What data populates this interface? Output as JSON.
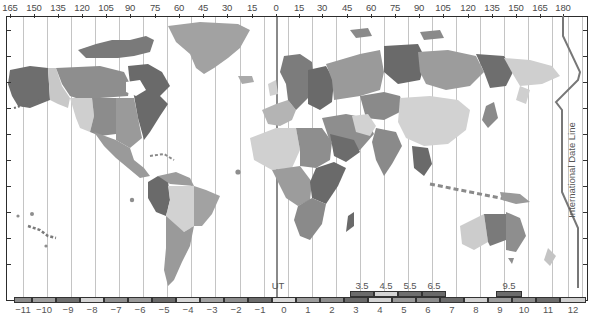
{
  "map": {
    "title": "World Time Zones",
    "longitude_labels": [
      {
        "label": "165",
        "x": 10
      },
      {
        "label": "150",
        "x": 34
      },
      {
        "label": "135",
        "x": 58
      },
      {
        "label": "120",
        "x": 82
      },
      {
        "label": "105",
        "x": 106
      },
      {
        "label": "90",
        "x": 130
      },
      {
        "label": "75",
        "x": 155
      },
      {
        "label": "60",
        "x": 179
      },
      {
        "label": "45",
        "x": 203
      },
      {
        "label": "30",
        "x": 227
      },
      {
        "label": "15",
        "x": 252
      },
      {
        "label": "0",
        "x": 276
      },
      {
        "label": "15",
        "x": 299
      },
      {
        "label": "30",
        "x": 322
      },
      {
        "label": "45",
        "x": 347
      },
      {
        "label": "60",
        "x": 371
      },
      {
        "label": "75",
        "x": 395
      },
      {
        "label": "90",
        "x": 419
      },
      {
        "label": "105",
        "x": 443
      },
      {
        "label": "120",
        "x": 468
      },
      {
        "label": "135",
        "x": 492
      },
      {
        "label": "150",
        "x": 516
      },
      {
        "label": "165",
        "x": 540
      },
      {
        "label": "180",
        "x": 563
      }
    ],
    "meridian_x": [
      23,
      47,
      71,
      95,
      119,
      143,
      167,
      191,
      215,
      240,
      264,
      276,
      288,
      312,
      336,
      360,
      384,
      408,
      432,
      456,
      480,
      504,
      528,
      552,
      568,
      582
    ],
    "ut_meridian_x": 276,
    "ut_label": "UT",
    "date_line_label": "International Date Line",
    "zone_strip": [
      {
        "label": "−11",
        "x": 14,
        "w": 18,
        "color": "#8c8c8c"
      },
      {
        "label": "−10",
        "x": 32,
        "w": 24,
        "color": "#9e9e9e"
      },
      {
        "label": "−9",
        "x": 56,
        "w": 24,
        "color": "#6e6e6e"
      },
      {
        "label": "−8",
        "x": 80,
        "w": 24,
        "color": "#d4d4d4"
      },
      {
        "label": "−7",
        "x": 104,
        "w": 24,
        "color": "#8e8e8e"
      },
      {
        "label": "−6",
        "x": 128,
        "w": 24,
        "color": "#9a9a9a"
      },
      {
        "label": "−5",
        "x": 152,
        "w": 24,
        "color": "#6a6a6a"
      },
      {
        "label": "−4",
        "x": 176,
        "w": 24,
        "color": "#d6d6d6"
      },
      {
        "label": "−3",
        "x": 200,
        "w": 24,
        "color": "#a2a2a2"
      },
      {
        "label": "−2",
        "x": 224,
        "w": 24,
        "color": "#8e8e8e"
      },
      {
        "label": "−1",
        "x": 248,
        "w": 24,
        "color": "#6c6c6c"
      },
      {
        "label": "0",
        "x": 272,
        "w": 24,
        "color": "#d8d8d8"
      },
      {
        "label": "1",
        "x": 296,
        "w": 24,
        "color": "#9c9c9c"
      },
      {
        "label": "2",
        "x": 320,
        "w": 24,
        "color": "#8e8e8e"
      },
      {
        "label": "3",
        "x": 344,
        "w": 24,
        "color": "#6a6a6a"
      },
      {
        "label": "4",
        "x": 368,
        "w": 24,
        "color": "#d4d4d4"
      },
      {
        "label": "5",
        "x": 392,
        "w": 24,
        "color": "#9a9a9a"
      },
      {
        "label": "6",
        "x": 416,
        "w": 24,
        "color": "#8c8c8c"
      },
      {
        "label": "7",
        "x": 440,
        "w": 24,
        "color": "#6c6c6c"
      },
      {
        "label": "8",
        "x": 464,
        "w": 24,
        "color": "#d2d2d2"
      },
      {
        "label": "9",
        "x": 488,
        "w": 24,
        "color": "#9c9c9c"
      },
      {
        "label": "10",
        "x": 512,
        "w": 24,
        "color": "#8c8c8c"
      },
      {
        "label": "11",
        "x": 536,
        "w": 24,
        "color": "#6c6c6c"
      },
      {
        "label": "12",
        "x": 560,
        "w": 26,
        "color": "#d0d0d0"
      }
    ],
    "half_hour_zones": [
      {
        "label": "3.5",
        "x": 350,
        "w": 24,
        "color": "#6c6c6c"
      },
      {
        "label": "4.5",
        "x": 374,
        "w": 24,
        "color": "#d4d4d4"
      },
      {
        "label": "5.5",
        "x": 398,
        "w": 24,
        "color": "#6e6e6e"
      },
      {
        "label": "6.5",
        "x": 422,
        "w": 24,
        "color": "#6a6a6a"
      },
      {
        "label": "9.5",
        "x": 496,
        "w": 26,
        "color": "#6c6c6c"
      }
    ],
    "colors": {
      "frame": "#2c2c2c",
      "meridian": "#c4c4c4",
      "ut_meridian": "#8a8a8a",
      "date_line": "#777777",
      "land_dark": "#6a6a6a",
      "land_mid": "#8e8e8e",
      "land_light": "#a4a4a4",
      "land_pale": "#d2d2d2",
      "ocean": "#ffffff"
    }
  }
}
